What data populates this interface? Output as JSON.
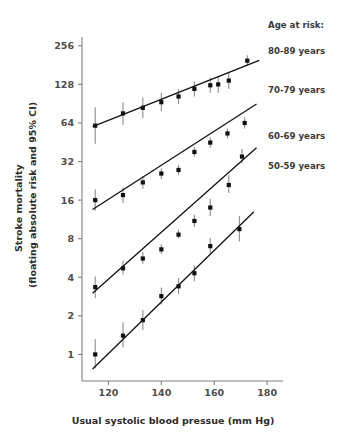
{
  "chart_data": {
    "type": "scatter",
    "title": "",
    "subtitle": "",
    "xlabel": "Usual systolic blood pressue (mm Hg)",
    "ylabel_line1": "Stroke mortality",
    "ylabel_line2": "(floating absolute risk and 95% CI)",
    "xlim": [
      110,
      186
    ],
    "ylim": [
      0.62,
      300
    ],
    "yscale": "log2",
    "xticks": [
      120,
      140,
      160,
      180
    ],
    "xtick_labels": [
      "120",
      "140",
      "160",
      "180"
    ],
    "yticks": [
      1,
      2,
      4,
      8,
      16,
      32,
      64,
      128,
      256
    ],
    "ytick_labels": [
      "1",
      "2",
      "4",
      "8",
      "16",
      "32",
      "64",
      "128",
      "256"
    ],
    "grid": false,
    "legend_position": "right",
    "legend_title": "Age at risk:",
    "series": [
      {
        "name": "80-89 years",
        "legend_y_value": 190,
        "x": [
          115,
          125.5,
          133,
          140,
          146.5,
          152.5,
          158.5,
          161.5,
          165.5,
          172.5
        ],
        "y": [
          61,
          76,
          84,
          93,
          103,
          118,
          126,
          128,
          137,
          196
        ],
        "ci_low": [
          44,
          62,
          70,
          79,
          90,
          103,
          110,
          110,
          118,
          178
        ],
        "ci_high": [
          85,
          93,
          101,
          110,
          118,
          135,
          145,
          149,
          159,
          216
        ],
        "fit_x": [
          114,
          177
        ],
        "fit_y": [
          60,
          197
        ]
      },
      {
        "name": "70-79 years",
        "legend_y_value": 96,
        "x": [
          115,
          125.5,
          133,
          140,
          146.5,
          152.5,
          158.5,
          165,
          171.5
        ],
        "y": [
          16.0,
          17.5,
          22.0,
          25.8,
          27.5,
          38.0,
          45.0,
          53.0,
          64.0
        ],
        "ci_low": [
          13.2,
          15.2,
          19.6,
          23.4,
          25.2,
          34.8,
          41.0,
          48.5,
          58.0
        ],
        "ci_high": [
          19.4,
          20.2,
          24.6,
          28.3,
          30.0,
          41.5,
          49.5,
          58.0,
          71.0
        ],
        "fit_x": [
          114,
          176
        ],
        "fit_y": [
          13.5,
          90.0
        ]
      },
      {
        "name": "60-69 years",
        "legend_y_value": 30,
        "x": [
          115,
          125.5,
          133,
          140,
          146.5,
          152.5,
          158.5,
          165.5,
          170.5
        ],
        "y": [
          3.35,
          4.7,
          5.6,
          6.6,
          8.6,
          11.0,
          14.0,
          21.0,
          35.0
        ],
        "ci_low": [
          2.75,
          4.2,
          5.1,
          6.1,
          8.0,
          9.9,
          12.0,
          18.2,
          31.0
        ],
        "ci_high": [
          4.05,
          5.4,
          6.3,
          7.2,
          9.4,
          12.3,
          16.4,
          25.0,
          40.0
        ],
        "fit_x": [
          114,
          176
        ],
        "fit_y": [
          3.0,
          41.0
        ]
      },
      {
        "name": "50-59 years",
        "legend_y_value": 17,
        "x": [
          115,
          125.5,
          133,
          140,
          146.5,
          152.5,
          158.5,
          169.5
        ],
        "y": [
          1.0,
          1.4,
          1.85,
          2.85,
          3.4,
          4.3,
          7.0,
          9.5
        ],
        "ci_low": [
          0.78,
          1.13,
          1.55,
          2.45,
          2.95,
          3.72,
          6.1,
          7.6
        ],
        "ci_high": [
          1.32,
          1.78,
          2.22,
          3.32,
          3.95,
          4.95,
          8.1,
          12.0
        ],
        "fit_x": [
          114,
          175
        ],
        "fit_y": [
          0.77,
          13.0
        ]
      }
    ]
  },
  "legend": {
    "title": "Age at risk:",
    "items": [
      {
        "label": "80-89 years"
      },
      {
        "label": "70-79 years"
      },
      {
        "label": "60-69 years"
      },
      {
        "label": "50-59 years"
      }
    ]
  },
  "axes": {
    "x_title": "Usual systolic blood pressue (mm Hg)",
    "y_title_line1": "Stroke mortality",
    "y_title_line2": "(floating absolute risk and 95% CI)"
  }
}
